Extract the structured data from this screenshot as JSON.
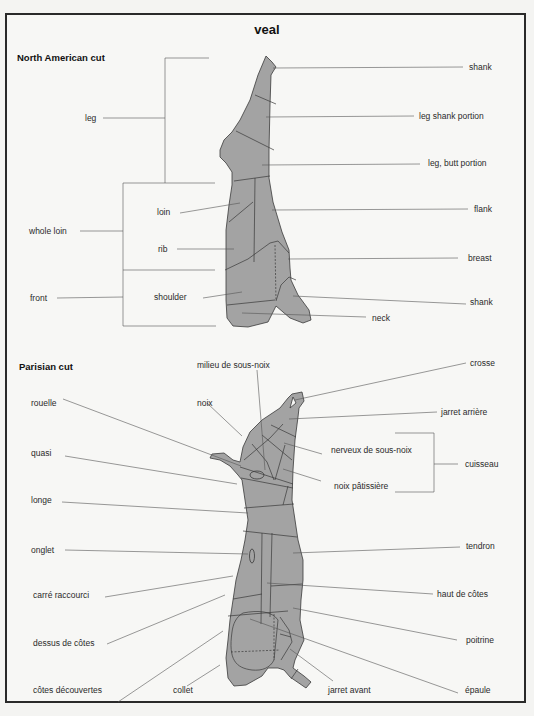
{
  "title": "veal",
  "sections": {
    "north_american": {
      "heading": "North American cut",
      "groups": {
        "leg": "leg",
        "whole_loin": "whole loin",
        "front": "front"
      },
      "left_labels": {
        "loin": "loin",
        "rib": "rib",
        "shoulder": "shoulder"
      },
      "right_labels": {
        "shank_top": "shank",
        "leg_shank_portion": "leg  shank portion",
        "leg_butt_portion": "leg, butt portion",
        "flank": "flank",
        "breast": "breast",
        "shank_bottom": "shank",
        "neck": "neck"
      }
    },
    "parisian": {
      "heading": "Parisian cut",
      "top_labels": {
        "milieu": "milieu de sous-noix",
        "noix": "noix"
      },
      "left_labels": {
        "rouelle": "rouelle",
        "quasi": "quasi",
        "longe": "longe",
        "onglet": "onglet",
        "carre_raccourci": "carré raccourci",
        "dessus_de_cotes": "dessus de côtes",
        "cotes_decouvertes": "côtes découvertes",
        "collet": "collet"
      },
      "right_labels": {
        "crosse": "crosse",
        "jarret_arriere": "jarret arrière",
        "nerveux": "nerveux de sous-noix",
        "noix_patissiere": "noix pâtissière",
        "cuisseau": "cuisseau",
        "tendron": "tendron",
        "haut_de_cotes": "haut de côtes",
        "poitrine": "poitrine",
        "jarret_avant": "jarret avant",
        "epaule": "épaule"
      }
    }
  },
  "colors": {
    "meat_fill": "#a3a3a3",
    "line": "#3a3a3a",
    "background": "#f7f7f5"
  }
}
